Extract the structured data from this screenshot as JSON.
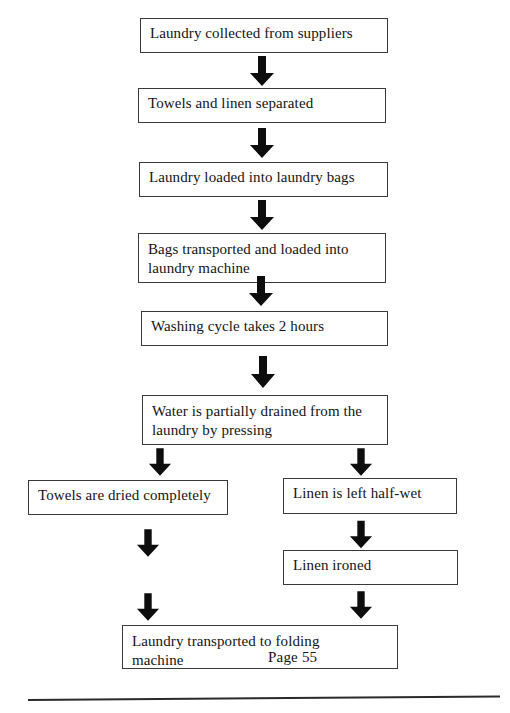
{
  "document": {
    "title": "Laundry Process Flowchart",
    "page_label": "Page 55"
  },
  "diagram": {
    "type": "flowchart",
    "orientation": "top-to-bottom",
    "nodes": [
      {
        "id": "n1",
        "label": "Laundry collected from suppliers"
      },
      {
        "id": "n2",
        "label": "Towels and linen separated"
      },
      {
        "id": "n3",
        "label": "Laundry loaded into laundry bags"
      },
      {
        "id": "n4",
        "label": "Bags transported and loaded into\nlaundry machine"
      },
      {
        "id": "n5",
        "label": "Washing cycle takes 2 hours"
      },
      {
        "id": "n6",
        "label": "Water is partially drained from the\nlaundry by pressing"
      },
      {
        "id": "n7",
        "label": "Towels are dried completely"
      },
      {
        "id": "n8",
        "label": "Linen is left half-wet"
      },
      {
        "id": "n9",
        "label": "Linen ironed"
      },
      {
        "id": "n10",
        "label": "Laundry transported to folding\nmachine"
      }
    ],
    "edges": [
      {
        "from": "n1",
        "to": "n2"
      },
      {
        "from": "n2",
        "to": "n3"
      },
      {
        "from": "n3",
        "to": "n4"
      },
      {
        "from": "n4",
        "to": "n5"
      },
      {
        "from": "n5",
        "to": "n6"
      },
      {
        "from": "n6",
        "to": "n7"
      },
      {
        "from": "n6",
        "to": "n8"
      },
      {
        "from": "n7",
        "to": "n10"
      },
      {
        "from": "n8",
        "to": "n9"
      },
      {
        "from": "n9",
        "to": "n10"
      }
    ],
    "colors": {
      "box_border": "#3a3a3a",
      "box_fill": "#ffffff",
      "arrow": "#0d0d0d",
      "text": "#141414",
      "rule": "#2b2b2b"
    }
  }
}
